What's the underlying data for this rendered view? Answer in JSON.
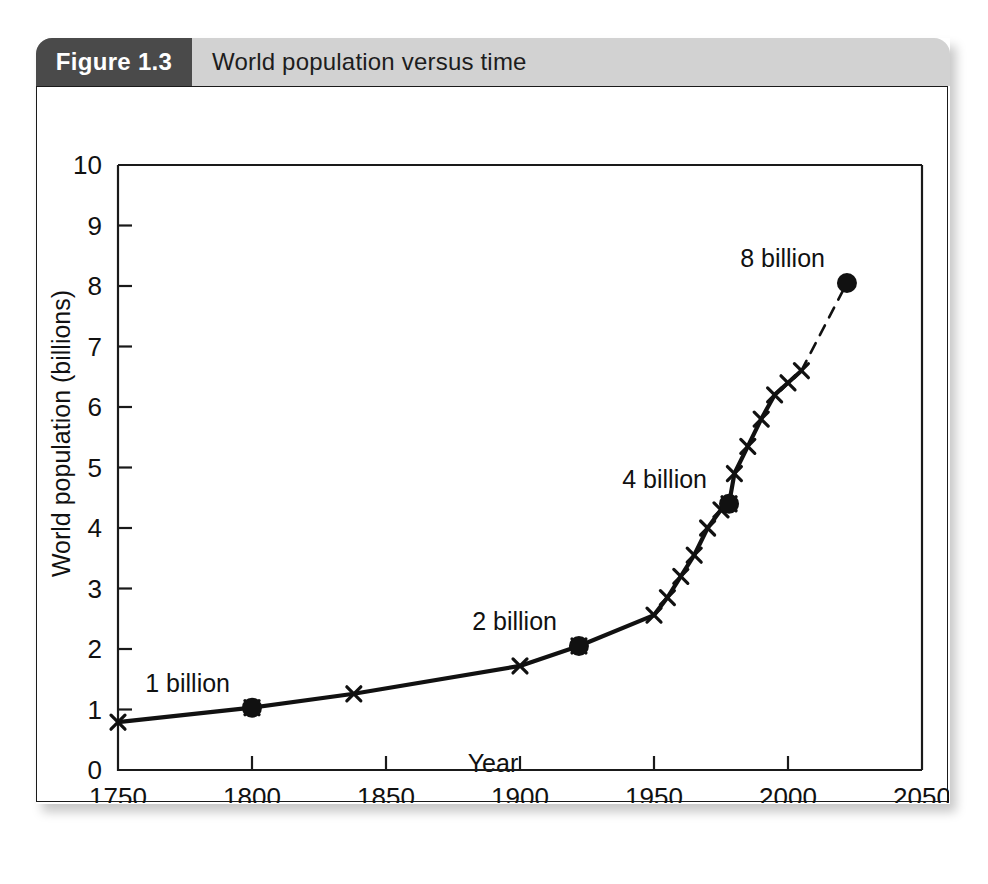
{
  "figure": {
    "tab_label": "Figure 1.3",
    "title": "World population versus time"
  },
  "chart_data": {
    "type": "line",
    "title": "World population versus time",
    "xlabel": "Year",
    "ylabel": "World population (billions)",
    "xlim": [
      1750,
      2050
    ],
    "ylim": [
      0,
      10
    ],
    "xticks": [
      1750,
      1800,
      1850,
      1900,
      1950,
      2000,
      2050
    ],
    "yticks": [
      0,
      1,
      2,
      3,
      4,
      5,
      6,
      7,
      8,
      9,
      10
    ],
    "grid": false,
    "legend": null,
    "series": [
      {
        "name": "World population (historical)",
        "marker": "x",
        "linestyle": "solid",
        "x": [
          1750,
          1800,
          1838,
          1900,
          1922,
          1950,
          1955,
          1960,
          1965,
          1970,
          1975,
          1978,
          1980,
          1985,
          1990,
          1995,
          2000,
          2005
        ],
        "values": [
          0.79,
          1.03,
          1.26,
          1.72,
          2.05,
          2.56,
          2.85,
          3.2,
          3.55,
          4.0,
          4.3,
          4.4,
          4.9,
          5.35,
          5.8,
          6.2,
          6.4,
          6.6
        ]
      },
      {
        "name": "World population (projected)",
        "marker": "o",
        "linestyle": "dashed",
        "x": [
          2005,
          2022
        ],
        "values": [
          6.6,
          8.05
        ]
      }
    ],
    "highlight_points": [
      {
        "label": "1 billion",
        "x": 1800,
        "y": 1.03
      },
      {
        "label": "2 billion",
        "x": 1922,
        "y": 2.05
      },
      {
        "label": "4 billion",
        "x": 1978,
        "y": 4.4
      },
      {
        "label": "8 billion",
        "x": 2022,
        "y": 8.05
      }
    ],
    "colors": {
      "line": "#111111",
      "marker": "#111111",
      "axis": "#1a1a1a",
      "header_band": "#d2d2d2",
      "tab": "#4a4a4a"
    }
  }
}
